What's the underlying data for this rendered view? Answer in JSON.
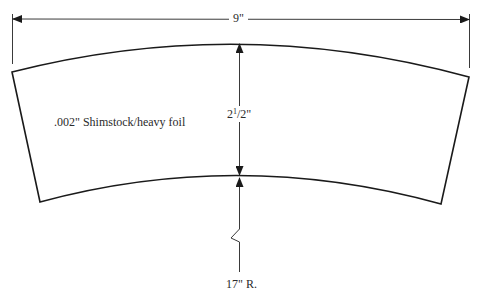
{
  "diagram": {
    "stroke_color": "#1a1a1a",
    "dimension_color": "#3a3a3a",
    "text_color": "#2b2b2b",
    "background": "#ffffff"
  },
  "labels": {
    "overall_width": "9\"",
    "band_height_whole": "2",
    "band_height_num": "1",
    "band_height_frac_sep": "/",
    "band_height_den": "2",
    "band_height_unit": "\"",
    "material": ".002\" Shimstock/heavy foil",
    "radius": "17\" R."
  },
  "dimensions": {
    "overall_width_in": 9,
    "band_height_in": 2.5,
    "inner_radius_in": 17,
    "material_thickness_in": 0.002
  }
}
